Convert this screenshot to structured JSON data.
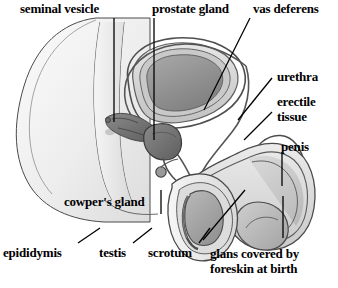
{
  "figure": {
    "type": "anatomical-diagram",
    "background_color": "#ffffff",
    "line_color": "#1a1a1a",
    "text_color": "#000000",
    "tones": {
      "skin_light": "#f2f2f2",
      "skin_mid": "#e2e2e2",
      "organ_light": "#d8d8d8",
      "organ_mid": "#b4b4b4",
      "organ_dark": "#8d8d8d",
      "organ_darkest": "#6b6b6b",
      "outline": "#3c3c3c"
    }
  },
  "labels": [
    {
      "id": "seminal-vesicle",
      "text": "seminal vesicle",
      "x": 20,
      "y": 2
    },
    {
      "id": "prostate-gland",
      "text": "prostate gland",
      "x": 152,
      "y": 2
    },
    {
      "id": "vas-deferens",
      "text": "vas deferens",
      "x": 253,
      "y": 2
    },
    {
      "id": "urethra",
      "text": "urethra",
      "x": 277,
      "y": 70
    },
    {
      "id": "erectile-tissue",
      "text": "erectile tissue",
      "x": 277,
      "y": 94
    },
    {
      "id": "penis",
      "text": "penis",
      "x": 281,
      "y": 140
    },
    {
      "id": "cowpers-gland",
      "text": "cowper's gland",
      "x": 64,
      "y": 195
    },
    {
      "id": "epididymis",
      "text": "epididymis",
      "x": 3,
      "y": 246
    },
    {
      "id": "testis",
      "text": "testis",
      "x": 99,
      "y": 246
    },
    {
      "id": "scrotum",
      "text": "scrotum",
      "x": 148,
      "y": 246
    },
    {
      "id": "glans-foreskin",
      "text": "glans covered by foreskin at birth",
      "x": 210,
      "y": 246
    }
  ],
  "leader_lines": [
    {
      "id": "seminal-vesicle-leader",
      "from": [
        114,
        18
      ],
      "to": [
        114,
        122
      ]
    },
    {
      "id": "prostate-gland-leader",
      "from": [
        154,
        18
      ],
      "to": [
        154,
        140
      ]
    },
    {
      "id": "vas-deferens-leader",
      "from": [
        250,
        18
      ],
      "to": [
        204,
        110
      ]
    },
    {
      "id": "urethra-leader",
      "from": [
        272,
        78
      ],
      "to": [
        238,
        120
      ]
    },
    {
      "id": "erectile-tissue-leader",
      "from": [
        272,
        112
      ],
      "to": [
        244,
        140
      ]
    },
    {
      "id": "penis-leader",
      "from": [
        282,
        152
      ],
      "to": [
        282,
        186
      ]
    },
    {
      "id": "cowpers-gland-leader",
      "from": [
        161,
        190
      ],
      "to": [
        161,
        214
      ]
    },
    {
      "id": "epididymis-leader",
      "from": [
        78,
        243
      ],
      "to": [
        100,
        228
      ]
    },
    {
      "id": "testis-leader",
      "from": [
        133,
        243
      ],
      "to": [
        152,
        228
      ]
    },
    {
      "id": "scrotum-leader",
      "from": [
        199,
        243
      ],
      "to": [
        210,
        228
      ]
    },
    {
      "id": "glans-foreskin-leader",
      "from": [
        203,
        240
      ],
      "to": [
        245,
        190
      ]
    },
    {
      "id": "glans-foreskin-stem",
      "from": [
        283,
        238
      ],
      "to": [
        283,
        196
      ]
    }
  ],
  "structures": [
    {
      "id": "body-outline",
      "name": "pelvic body contour"
    },
    {
      "id": "bladder",
      "name": "bladder"
    },
    {
      "id": "prostate",
      "name": "prostate gland"
    },
    {
      "id": "seminal-vesicle",
      "name": "seminal vesicle"
    },
    {
      "id": "vas-deferens",
      "name": "vas deferens"
    },
    {
      "id": "urethra",
      "name": "urethra"
    },
    {
      "id": "erectile-tissue",
      "name": "erectile tissue"
    },
    {
      "id": "penis-shaft",
      "name": "penis"
    },
    {
      "id": "glans",
      "name": "glans"
    },
    {
      "id": "scrotum",
      "name": "scrotum"
    },
    {
      "id": "testis",
      "name": "testis"
    },
    {
      "id": "epididymis",
      "name": "epididymis"
    },
    {
      "id": "cowpers-gland",
      "name": "cowper's gland"
    },
    {
      "id": "rectum",
      "name": "rectum"
    }
  ]
}
